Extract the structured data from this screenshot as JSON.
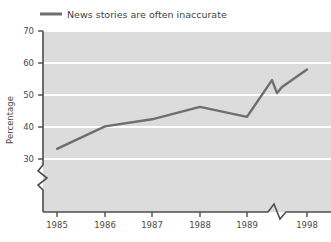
{
  "chart_data": {
    "type": "line",
    "title": "",
    "xlabel": "",
    "ylabel": "Percentage",
    "ylim": [
      30,
      70
    ],
    "yticks": [
      30,
      40,
      50,
      60,
      70
    ],
    "ytick_labels": [
      "30",
      "40",
      "50",
      "60",
      "70"
    ],
    "xtick_labels": [
      "1985",
      "1986",
      "1987",
      "1988",
      "1989",
      "1998"
    ],
    "grid": "horizontal-white",
    "legend_position": "top-left",
    "y_axis_break": true,
    "x_axis_break": true,
    "series": [
      {
        "name": "News stories are often inaccurate",
        "color": "#6e6e6e",
        "x": [
          "1985",
          "1986",
          "1987",
          "1988",
          "1989",
          "1998"
        ],
        "values": [
          33.2,
          40.2,
          42.4,
          46.3,
          43.2,
          58.0
        ]
      }
    ],
    "annotations": [
      "Line interrupted by axis break between 1989 and 1998",
      "Y axis interrupted below 30"
    ]
  },
  "legend": {
    "entries": [
      {
        "label": "News stories are often inaccurate",
        "swatch_color": "#6e6e6e"
      }
    ]
  },
  "axes": {
    "y_title": "Percentage",
    "y_labels": [
      "70",
      "60",
      "50",
      "40",
      "30"
    ],
    "x_labels": [
      "1985",
      "1986",
      "1987",
      "1988",
      "1989",
      "1998"
    ]
  },
  "colors": {
    "plot_background": "#dcdcdc",
    "gridline": "#ffffff",
    "axis_line": "#4d4d4d",
    "series_line": "#6e6e6e",
    "page_background": "#ffffff"
  }
}
